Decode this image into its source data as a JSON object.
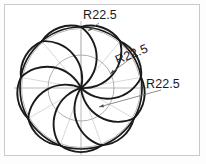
{
  "drawing": {
    "title": "Rosette petal construction drawing",
    "sheet": {
      "frame_color": "#c9c9c9",
      "background_color": "#ffffff"
    },
    "colors": {
      "object_line": "#1a1a1a",
      "construction_line": "#9a9a9a",
      "center_line": "#a8a8a8",
      "leader_line": "#6e6e6e",
      "text": "#1a1a1a"
    },
    "geometry": {
      "center_x": 81,
      "center_y": 88,
      "outer_circle_radius": 61,
      "inner_circle_radius": 33,
      "petal_count": 9,
      "petal_radius_label": "R22.5"
    },
    "dimensions": [
      {
        "id": "dim-top",
        "label": "R22.5",
        "text_x": 100,
        "text_y": 19,
        "rotation": 0,
        "leader_from_x": 99,
        "leader_from_y": 23,
        "leader_to_x": 88,
        "leader_to_y": 31,
        "arrow_angle": 145
      },
      {
        "id": "dim-middle",
        "label": "R22.5",
        "text_x": 133,
        "text_y": 58,
        "rotation": -22,
        "leader_from_x": 131,
        "leader_from_y": 58,
        "leader_to_x": 110,
        "leader_to_y": 74,
        "arrow_angle": 218
      },
      {
        "id": "dim-lower",
        "label": "R22.5",
        "text_x": 163,
        "text_y": 88,
        "rotation": 0,
        "leader_from_x": 161,
        "leader_from_y": 90,
        "leader_to_x": 99,
        "leader_to_y": 107,
        "arrow_angle": 195
      }
    ],
    "centerlines": {
      "horizontal": {
        "x1": 14,
        "y1": 88,
        "x2": 150,
        "y2": 88
      },
      "vertical": {
        "x1": 81,
        "y1": 21,
        "x2": 81,
        "y2": 155
      }
    }
  }
}
